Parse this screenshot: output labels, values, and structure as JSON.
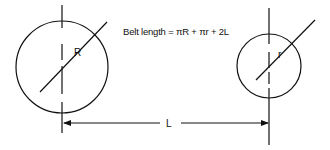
{
  "diagram": {
    "formula": "Belt length = πR + πr + 2L",
    "large_pulley": {
      "radius_label": "R"
    },
    "small_pulley": {
      "radius_label": "r"
    },
    "center_distance": {
      "label": "L"
    },
    "colors": {
      "line": "#111111",
      "background": "#ffffff"
    }
  }
}
